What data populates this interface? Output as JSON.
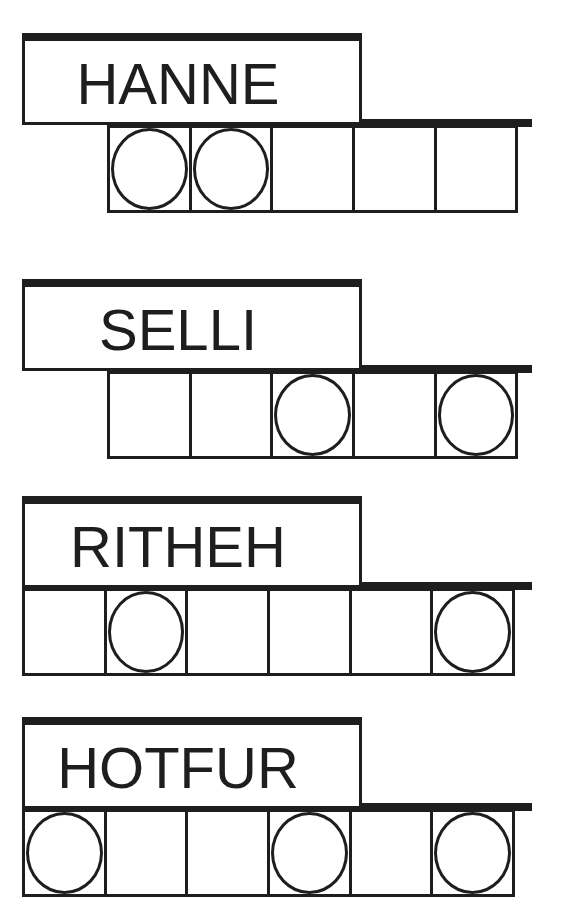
{
  "puzzles": [
    {
      "scrambled": "HANNE",
      "length": 5,
      "circled": [
        0,
        1
      ]
    },
    {
      "scrambled": "SELLI",
      "length": 5,
      "circled": [
        2,
        4
      ]
    },
    {
      "scrambled": "RITHEH",
      "length": 6,
      "circled": [
        1,
        5
      ]
    },
    {
      "scrambled": "HOTFUR",
      "length": 6,
      "circled": [
        0,
        3,
        5
      ]
    }
  ],
  "colors": {
    "ink": "#1e1e1e",
    "paper": "#ffffff"
  }
}
